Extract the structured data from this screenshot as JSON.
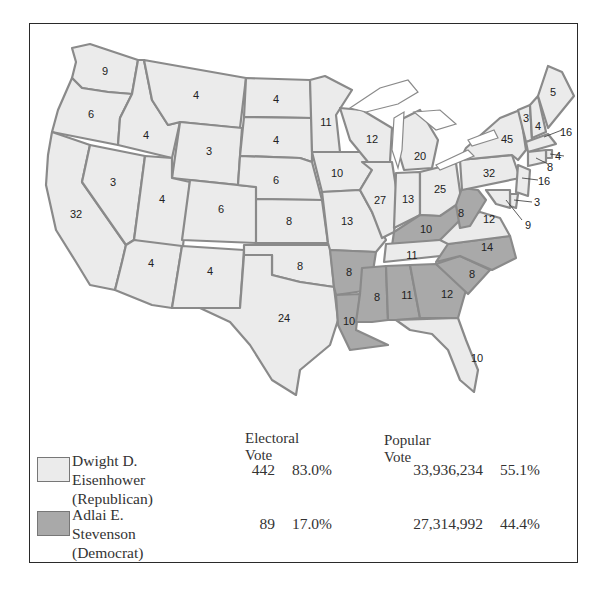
{
  "map": {
    "title": "1952 Presidential Election Results",
    "colors": {
      "republican": "#ebebeb",
      "democrat": "#a9a9a9",
      "border": "#8a8a8a"
    },
    "states": [
      {
        "abbr": "WA",
        "votes": "9",
        "party": "rep"
      },
      {
        "abbr": "OR",
        "votes": "6",
        "party": "rep"
      },
      {
        "abbr": "CA",
        "votes": "32",
        "party": "rep"
      },
      {
        "abbr": "ID",
        "votes": "4",
        "party": "rep"
      },
      {
        "abbr": "NV",
        "votes": "3",
        "party": "rep"
      },
      {
        "abbr": "MT",
        "votes": "4",
        "party": "rep"
      },
      {
        "abbr": "WY",
        "votes": "3",
        "party": "rep"
      },
      {
        "abbr": "UT",
        "votes": "4",
        "party": "rep"
      },
      {
        "abbr": "AZ",
        "votes": "4",
        "party": "rep"
      },
      {
        "abbr": "CO",
        "votes": "6",
        "party": "rep"
      },
      {
        "abbr": "NM",
        "votes": "4",
        "party": "rep"
      },
      {
        "abbr": "ND",
        "votes": "4",
        "party": "rep"
      },
      {
        "abbr": "SD",
        "votes": "4",
        "party": "rep"
      },
      {
        "abbr": "NE",
        "votes": "6",
        "party": "rep"
      },
      {
        "abbr": "KS",
        "votes": "8",
        "party": "rep"
      },
      {
        "abbr": "OK",
        "votes": "8",
        "party": "rep"
      },
      {
        "abbr": "TX",
        "votes": "24",
        "party": "rep"
      },
      {
        "abbr": "MN",
        "votes": "11",
        "party": "rep"
      },
      {
        "abbr": "IA",
        "votes": "10",
        "party": "rep"
      },
      {
        "abbr": "MO",
        "votes": "13",
        "party": "rep"
      },
      {
        "abbr": "AR",
        "votes": "8",
        "party": "dem"
      },
      {
        "abbr": "LA",
        "votes": "10",
        "party": "dem"
      },
      {
        "abbr": "WI",
        "votes": "12",
        "party": "rep"
      },
      {
        "abbr": "IL",
        "votes": "27",
        "party": "rep"
      },
      {
        "abbr": "MI",
        "votes": "20",
        "party": "rep"
      },
      {
        "abbr": "IN",
        "votes": "13",
        "party": "rep"
      },
      {
        "abbr": "OH",
        "votes": "25",
        "party": "rep"
      },
      {
        "abbr": "KY",
        "votes": "10",
        "party": "dem"
      },
      {
        "abbr": "TN",
        "votes": "11",
        "party": "rep"
      },
      {
        "abbr": "MS",
        "votes": "8",
        "party": "dem"
      },
      {
        "abbr": "AL",
        "votes": "11",
        "party": "dem"
      },
      {
        "abbr": "GA",
        "votes": "12",
        "party": "dem"
      },
      {
        "abbr": "FL",
        "votes": "10",
        "party": "rep"
      },
      {
        "abbr": "SC",
        "votes": "8",
        "party": "dem"
      },
      {
        "abbr": "NC",
        "votes": "14",
        "party": "dem"
      },
      {
        "abbr": "VA",
        "votes": "12",
        "party": "rep"
      },
      {
        "abbr": "WV",
        "votes": "8",
        "party": "dem"
      },
      {
        "abbr": "PA",
        "votes": "32",
        "party": "rep"
      },
      {
        "abbr": "NY",
        "votes": "45",
        "party": "rep"
      },
      {
        "abbr": "VT",
        "votes": "3",
        "party": "rep"
      },
      {
        "abbr": "NH",
        "votes": "4",
        "party": "rep"
      },
      {
        "abbr": "ME",
        "votes": "5",
        "party": "rep"
      },
      {
        "abbr": "MA",
        "votes": "16",
        "party": "rep"
      },
      {
        "abbr": "RI",
        "votes": "4",
        "party": "rep"
      },
      {
        "abbr": "CT",
        "votes": "8",
        "party": "rep"
      },
      {
        "abbr": "NJ",
        "votes": "16",
        "party": "rep"
      },
      {
        "abbr": "DE",
        "votes": "3",
        "party": "rep"
      },
      {
        "abbr": "MD",
        "votes": "9",
        "party": "rep"
      }
    ]
  },
  "legend": {
    "headers": {
      "electoral": "Electoral Vote",
      "popular": "Popular Vote"
    },
    "rows": [
      {
        "name": "Dwight D. Eisenhower",
        "party": "(Republican)",
        "ev": "442",
        "ev_pct": "83.0%",
        "pv": "33,936,234",
        "pv_pct": "55.1%",
        "swatch": "#ebebeb"
      },
      {
        "name": "Adlai E. Stevenson",
        "party": "(Democrat)",
        "ev": "89",
        "ev_pct": "17.0%",
        "pv": "27,314,992",
        "pv_pct": "44.4%",
        "swatch": "#a9a9a9"
      }
    ]
  }
}
